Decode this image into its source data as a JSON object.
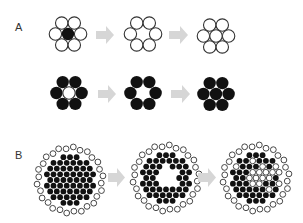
{
  "panels": [
    {
      "label": "A",
      "rows": [
        {
          "name": "open-circle-row",
          "stages": [
            {
              "description": "hexagonal cluster of 7 open circles with filled center",
              "center": "filled",
              "ring": "open",
              "ring_count": 6
            },
            {
              "description": "ring of 6 open circles, center vacant",
              "center": "empty",
              "ring": "open",
              "ring_count": 6
            },
            {
              "description": "cluster of 7 open circles, center refilled",
              "center": "open",
              "ring": "open",
              "ring_count": 6
            }
          ]
        },
        {
          "name": "filled-circle-row",
          "stages": [
            {
              "description": "ring of 6 filled circles around open center",
              "center": "open",
              "ring": "filled",
              "ring_count": 6
            },
            {
              "description": "ring of 6 filled circles, center vacant",
              "center": "empty",
              "ring": "filled",
              "ring_count": 6
            },
            {
              "description": "cluster of 7 filled circles",
              "center": "filled",
              "ring": "filled",
              "ring_count": 6
            }
          ]
        }
      ]
    },
    {
      "label": "B",
      "stages": [
        {
          "description": "dense disc of filled circles bordered by open circles",
          "pattern": "solid"
        },
        {
          "description": "disc of filled circles with vacant central hole, bordered by open circles",
          "pattern": "hole"
        },
        {
          "description": "disc with mixed open and filled circles in interior, bordered by open circles",
          "pattern": "mixed"
        }
      ]
    }
  ],
  "colors": {
    "filled": "#111111",
    "open_stroke": "#333333",
    "open_fill": "#ffffff",
    "arrow": "#d6d6d6",
    "label": "#333333"
  }
}
